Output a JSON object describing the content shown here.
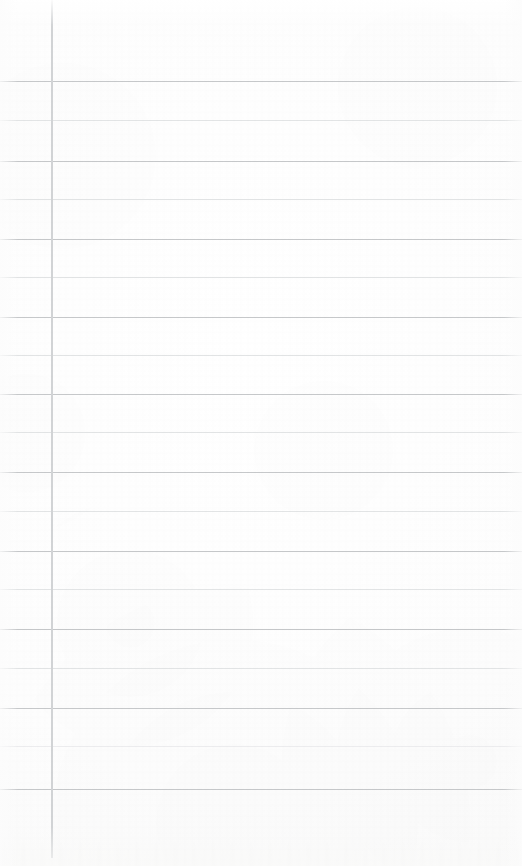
{
  "document": {
    "kind": "scanned-ruled-notebook-page",
    "title": "",
    "content_text": "",
    "page_number": "",
    "header_text": "",
    "footer_text": ""
  },
  "paper": {
    "background_color": "#fdfdfd",
    "edge_color": "#f6f6f5",
    "width_px": 522,
    "height_px": 866
  },
  "ruling": {
    "vertical_rule": {
      "label": "margin-rule",
      "x_px": 51,
      "top_px": 0,
      "bottom_px": 858,
      "color": "#d2d4d6",
      "thickness_px": 2
    },
    "horizontal_rule_colors": {
      "dark": "#c6c8ca",
      "light": "#e2e4e5",
      "faint": "#ececee"
    },
    "horizontal_rules": [
      {
        "index": 1,
        "y_px": 81,
        "weight": "dark"
      },
      {
        "index": 2,
        "y_px": 120,
        "weight": "light"
      },
      {
        "index": 3,
        "y_px": 161,
        "weight": "dark"
      },
      {
        "index": 4,
        "y_px": 199,
        "weight": "light"
      },
      {
        "index": 5,
        "y_px": 239,
        "weight": "dark"
      },
      {
        "index": 6,
        "y_px": 277,
        "weight": "light"
      },
      {
        "index": 7,
        "y_px": 317,
        "weight": "dark"
      },
      {
        "index": 8,
        "y_px": 355,
        "weight": "light"
      },
      {
        "index": 9,
        "y_px": 394,
        "weight": "dark"
      },
      {
        "index": 10,
        "y_px": 432,
        "weight": "light"
      },
      {
        "index": 11,
        "y_px": 472,
        "weight": "dark"
      },
      {
        "index": 12,
        "y_px": 511,
        "weight": "light"
      },
      {
        "index": 13,
        "y_px": 551,
        "weight": "dark"
      },
      {
        "index": 14,
        "y_px": 589,
        "weight": "light"
      },
      {
        "index": 15,
        "y_px": 629,
        "weight": "dark"
      },
      {
        "index": 16,
        "y_px": 668,
        "weight": "light"
      },
      {
        "index": 17,
        "y_px": 708,
        "weight": "dark"
      },
      {
        "index": 18,
        "y_px": 746,
        "weight": "faint"
      },
      {
        "index": 19,
        "y_px": 789,
        "weight": "dark"
      }
    ]
  },
  "regions": {
    "margin_column_label": "",
    "writing_area_label": ""
  }
}
